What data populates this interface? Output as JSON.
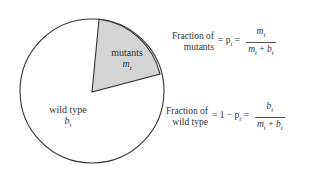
{
  "pie": {
    "segments": [
      {
        "name": "mutants",
        "label": "mutants",
        "symbol": "m_t",
        "fill": "#d4d4d4"
      },
      {
        "name": "wild-type",
        "label": "wild type",
        "symbol": "b_t",
        "fill": "#ffffff"
      }
    ],
    "stroke": "#333333"
  },
  "labels": {
    "mutants": "mutants",
    "mutants_symbol": "m",
    "mutants_sub": "t",
    "wild_type": "wild type",
    "wild_type_symbol": "b",
    "wild_type_sub": "t"
  },
  "equations": {
    "mutants": {
      "left_line1": "Fraction of",
      "left_line2": "mutants",
      "middle": "= p",
      "middle_sub": "t",
      "eq2": " =",
      "numerator": "m",
      "numerator_sub": "t",
      "denominator_a": "m",
      "denominator_a_sub": "t",
      "plus": " + ",
      "denominator_b": "b",
      "denominator_b_sub": "t"
    },
    "wild_type": {
      "left_line1": "Fraction of",
      "left_line2": "wild type",
      "middle": "= 1 − p",
      "middle_sub": "t",
      "eq2": " =",
      "numerator": "b",
      "numerator_sub": "t",
      "denominator_a": "m",
      "denominator_a_sub": "t",
      "plus": " + ",
      "denominator_b": "b",
      "denominator_b_sub": "t"
    }
  }
}
